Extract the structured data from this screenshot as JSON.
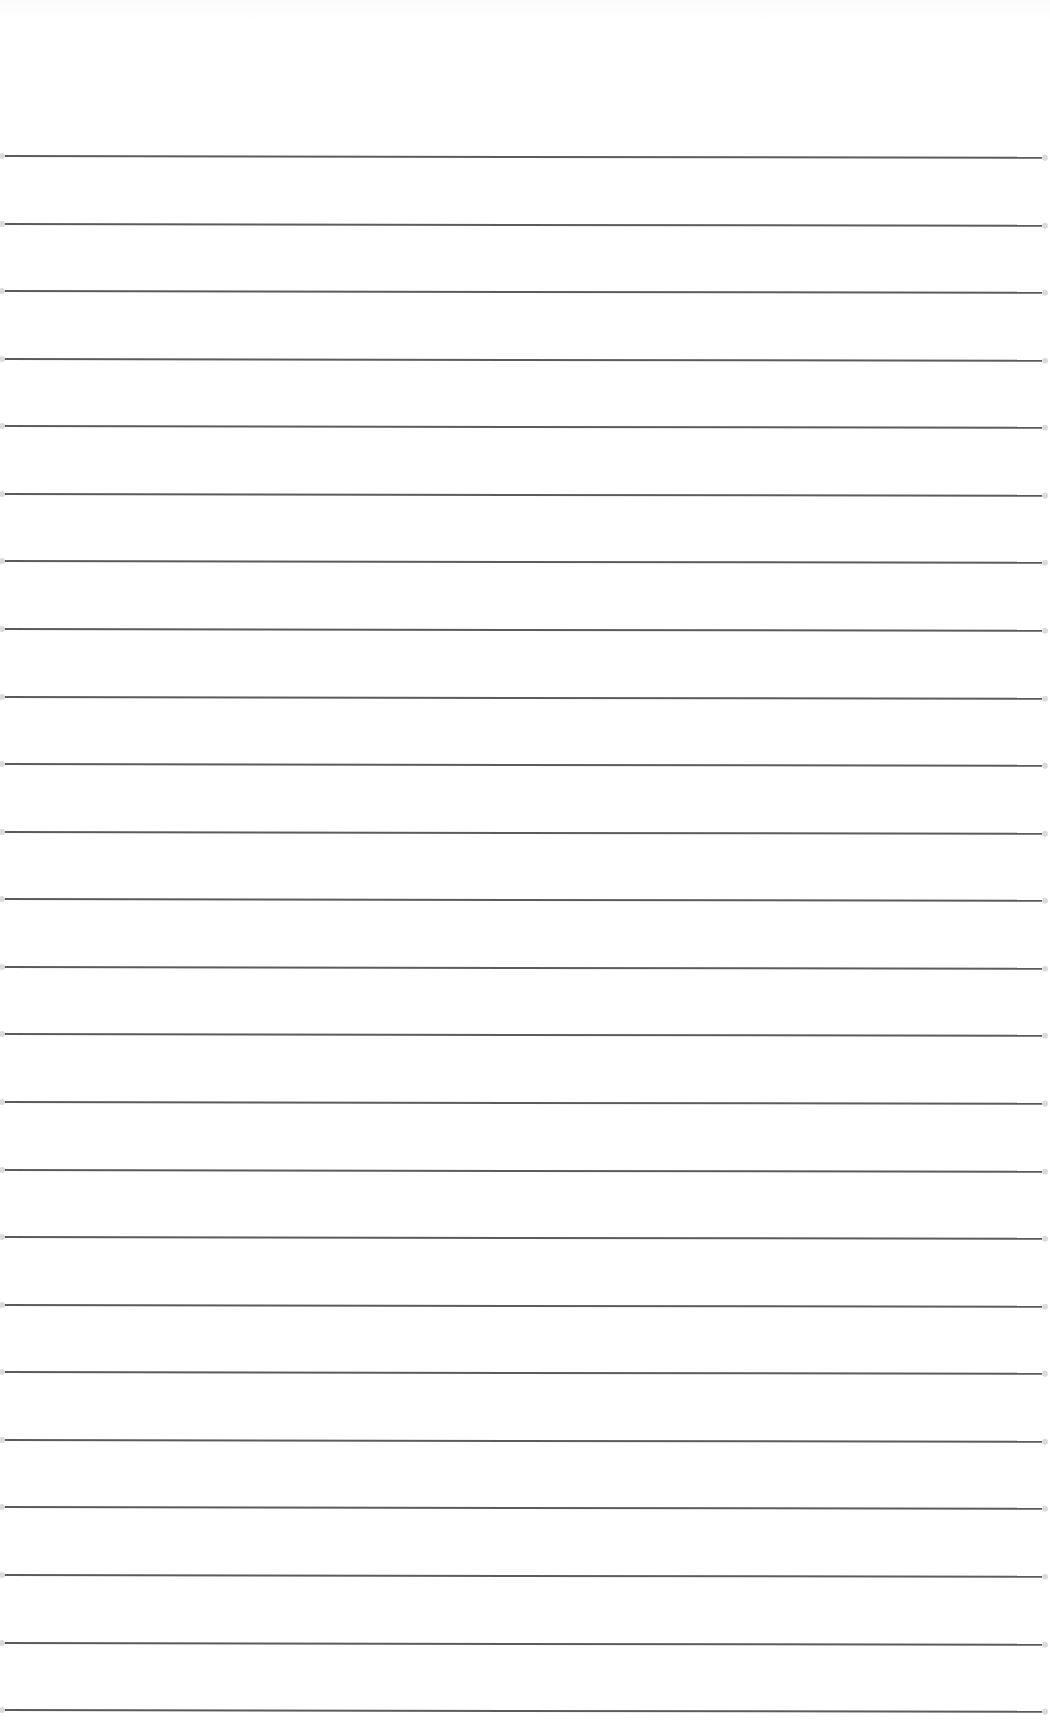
{
  "page": {
    "type": "blank lined paper",
    "background_color": "#ffffff",
    "line_color": "#4a4a4a",
    "line_count": 24,
    "first_line_y": 155,
    "line_spacing": 67.57,
    "line_left_x": 4,
    "line_right_x": 1042,
    "text": ""
  }
}
